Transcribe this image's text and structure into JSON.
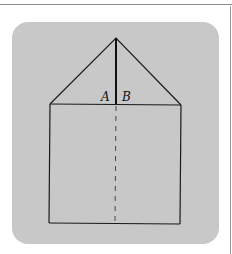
{
  "figure": {
    "labels": {
      "a": "A",
      "b": "B"
    },
    "colors": {
      "panel": "#c8c8c8",
      "stroke": "#1a1a1a",
      "dashed": "#444444"
    },
    "shapes": {
      "square": "house body (rectangle) below roof",
      "roof": "isosceles triangle on top of square",
      "altitude": "solid vertical line from apex to base of triangle",
      "center_line": "dashed vertical line through square"
    }
  }
}
